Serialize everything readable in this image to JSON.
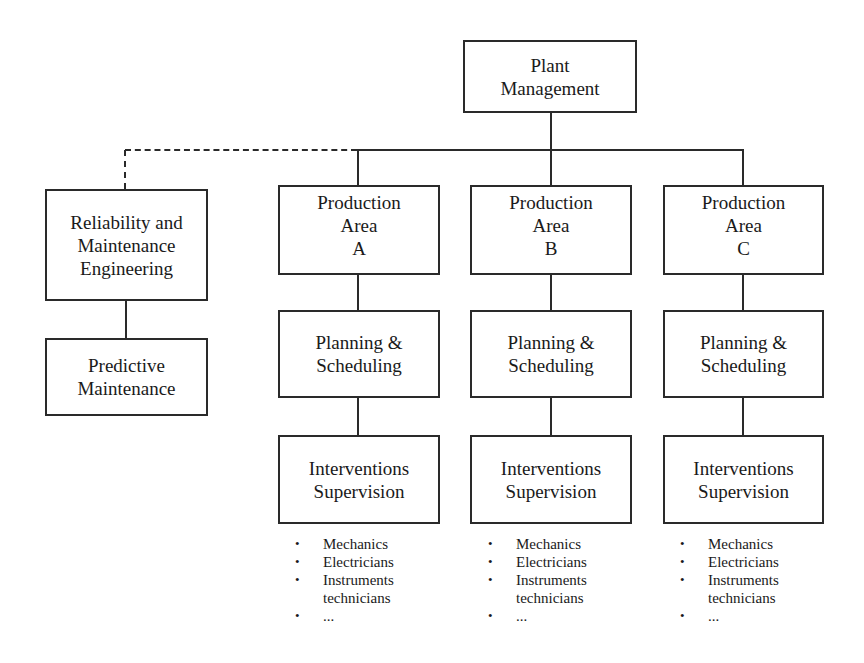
{
  "diagram": {
    "type": "org-chart",
    "root": {
      "lines": [
        "Plant",
        "Management"
      ]
    },
    "staff": {
      "connector": "dashed",
      "box1": {
        "lines": [
          "Reliability and",
          "Maintenance",
          "Engineering"
        ]
      },
      "box2": {
        "lines": [
          "Predictive",
          "Maintenance"
        ]
      }
    },
    "areas": [
      {
        "production": {
          "lines": [
            "Production",
            "Area",
            "A"
          ]
        },
        "planning": {
          "lines": [
            "Planning &",
            "Scheduling"
          ]
        },
        "interventions": {
          "lines": [
            "Interventions",
            "Supervision"
          ]
        },
        "staff_list": [
          "Mechanics",
          "Electricians",
          "Instruments",
          "technicians",
          "..."
        ]
      },
      {
        "production": {
          "lines": [
            "Production",
            "Area",
            "B"
          ]
        },
        "planning": {
          "lines": [
            "Planning &",
            "Scheduling"
          ]
        },
        "interventions": {
          "lines": [
            "Interventions",
            "Supervision"
          ]
        },
        "staff_list": [
          "Mechanics",
          "Electricians",
          "Instruments",
          "technicians",
          "..."
        ]
      },
      {
        "production": {
          "lines": [
            "Production",
            "Area",
            "C"
          ]
        },
        "planning": {
          "lines": [
            "Planning &",
            "Scheduling"
          ]
        },
        "interventions": {
          "lines": [
            "Interventions",
            "Supervision"
          ]
        },
        "staff_list": [
          "Mechanics",
          "Electricians",
          "Instruments",
          "technicians",
          "..."
        ]
      }
    ],
    "colors": {
      "line": "#2a2a2a",
      "background": "#ffffff",
      "text": "#1a1a1a"
    }
  }
}
